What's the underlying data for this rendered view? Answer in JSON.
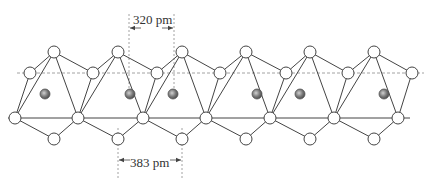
{
  "diagram": {
    "title": "",
    "annotations": {
      "top_distance": "320 pm",
      "bottom_distance": "383 pm"
    },
    "colors": {
      "line": "#444444",
      "dashed": "#8a8a8a",
      "node_fill": "#ffffff",
      "metal_fill": "#7a7a7a"
    },
    "geometry": {
      "top_nodes_x": [
        54,
        118,
        182,
        246,
        310,
        374
      ],
      "top_y": 52,
      "mid_nodes_x": [
        30,
        93,
        157,
        220,
        286,
        348,
        412
      ],
      "mid_y": 73,
      "base_nodes_x": [
        15,
        78,
        143,
        206,
        270,
        334,
        398
      ],
      "base_y": 118,
      "low_nodes_x": [
        54,
        118,
        182,
        246,
        310,
        374
      ],
      "low_y": 139,
      "metal_x": [
        45,
        130,
        173,
        257,
        300,
        384
      ],
      "metal_y": 94,
      "top_dim_x": [
        129,
        174
      ],
      "bottom_dim_x": [
        118,
        182
      ]
    }
  }
}
